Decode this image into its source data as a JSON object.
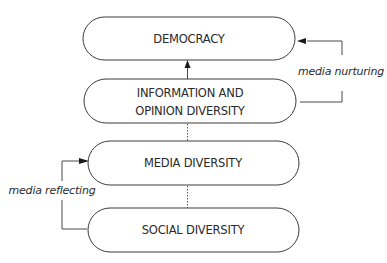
{
  "diagram": {
    "nodes": [
      {
        "id": "democracy",
        "lines": [
          "DEMOCRACY"
        ]
      },
      {
        "id": "information-opinion-diversity",
        "lines": [
          "INFORMATION AND",
          "OPINION DIVERSITY"
        ]
      },
      {
        "id": "media-diversity",
        "lines": [
          "MEDIA DIVERSITY"
        ]
      },
      {
        "id": "social-diversity",
        "lines": [
          "SOCIAL DIVERSITY"
        ]
      }
    ],
    "edges": [
      {
        "from": "information-opinion-diversity",
        "to": "democracy",
        "style": "solid-arrow"
      },
      {
        "from": "media-diversity",
        "to": "information-opinion-diversity",
        "style": "dotted"
      },
      {
        "from": "social-diversity",
        "to": "media-diversity",
        "style": "dotted"
      },
      {
        "from": "information-opinion-diversity",
        "to": "democracy",
        "style": "elbow-arrow",
        "label": "media nurturing"
      },
      {
        "from": "social-diversity",
        "to": "media-diversity",
        "style": "elbow-arrow",
        "label": "media reflecting"
      }
    ],
    "labels": {
      "nurturing": "media nurturing",
      "reflecting": "media reflecting"
    }
  }
}
